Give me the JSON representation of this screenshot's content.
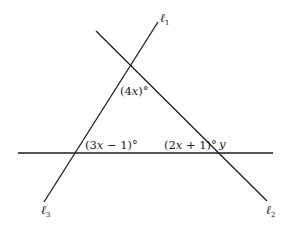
{
  "diagram": {
    "lines": [
      {
        "id": "l1",
        "name": "ℓ",
        "subscript": "1"
      },
      {
        "id": "l2",
        "name": "ℓ",
        "subscript": "2"
      },
      {
        "id": "l3",
        "name": "ℓ",
        "subscript": "3"
      }
    ],
    "angles": {
      "top": {
        "open": "(4",
        "var": "x",
        "close": ")°"
      },
      "bottom_left": {
        "open": "(3",
        "var": "x",
        "close": " − 1)°"
      },
      "bottom_right": {
        "open": "(2",
        "var": "x",
        "close": " + 1)°"
      },
      "exterior": {
        "var": "y"
      }
    }
  }
}
